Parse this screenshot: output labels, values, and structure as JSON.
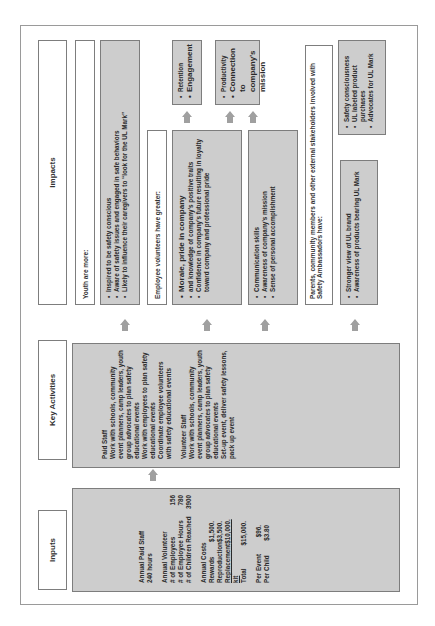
{
  "headers": {
    "inputs": "Inputs",
    "key_activities": "Key Activities",
    "impacts": "Impacts"
  },
  "inputs": {
    "paid_staff_title": "Annual Paid Staff",
    "paid_staff_hours": "240 hours",
    "volunteer_title": "Annual Volunteer",
    "volunteer_rows": [
      {
        "label": "# of Employees",
        "value": "156"
      },
      {
        "label": "# of Employee Hours",
        "value": "780"
      },
      {
        "label": "# of Children Reached",
        "value": "3900"
      }
    ],
    "costs_title": "Annual Costs",
    "cost_rows": [
      {
        "label": "Rewards",
        "value": "$1,500."
      },
      {
        "label": "Reproduction",
        "value": "$3,500."
      },
      {
        "label": "Replacement kit",
        "value": "$10,000."
      },
      {
        "label": "Total",
        "value": "$15,000."
      }
    ],
    "per_rows": [
      {
        "label": "Per Event",
        "value": "$96."
      },
      {
        "label": "Per Child",
        "value": "$3.80"
      }
    ]
  },
  "key_activities": {
    "paid_staff_title": "Paid Staff",
    "paid_staff_items": [
      "Work with schools, community event planners, camp leaders, youth group advocates to plan safety educational events",
      "Work with employees to plan safety educational events",
      "Coordinate employee volunteers with safety educational events"
    ],
    "volunteer_title": "Volunteer Staff",
    "volunteer_items": [
      "Work with schools, community event planners, camp leaders, youth group advocates to plan safety educational events",
      "Set-up event, deliver safety lessons, pack up event"
    ]
  },
  "impacts": {
    "youth": {
      "label": "Youth are more:",
      "items": [
        "Inspired to be safety conscious",
        "Aware of safety issues and engaged in safe behaviors",
        "Likely to influence their caregivers to “look for the UL Mark”"
      ]
    },
    "employees": {
      "label": "Employee volunteers have greater:",
      "box1_items": [
        "Morale, pride in company",
        "and knowledge of company’s positive traits",
        "Confidence in company’s future resulting in loyalty toward company and professional pride"
      ],
      "box2_items": [
        "Communication skills",
        "Awareness of company’s mission",
        "Sense of personal accomplishment"
      ],
      "outcome1_items": [
        "Retention",
        "Engagement"
      ],
      "outcome2_items": [
        "Productivity",
        "Connection to company’s mission"
      ]
    },
    "stakeholders": {
      "label": "Parents, community members and other external stakeholders involved with Safety Ambassadors have:",
      "box_items": [
        "Stronger view of UL brand",
        "Awareness of products bearing UL Mark"
      ],
      "outcome_items": [
        "Safety consciousness",
        "UL labeled product purchases",
        "Advocates for UL Mark"
      ]
    }
  },
  "colors": {
    "box_gray": "#cdcdcd",
    "arrow_gray": "#a0a0a0",
    "border": "#7d7d7d"
  }
}
